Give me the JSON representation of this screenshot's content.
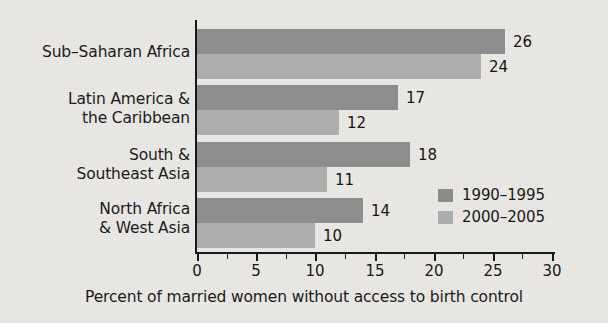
{
  "chart_data": {
    "type": "bar",
    "orientation": "horizontal",
    "title": "",
    "xlabel": "Percent of married women without access to birth control",
    "ylabel": "",
    "xlim": [
      0,
      30
    ],
    "xticks": [
      0,
      5,
      10,
      15,
      20,
      25,
      30
    ],
    "xtick_labels": [
      "0",
      "5",
      "10",
      "15",
      "20",
      "25",
      "30"
    ],
    "grid": false,
    "legend_position": "inside-right",
    "categories": [
      "Sub–Saharan Africa",
      "Latin America &\nthe Caribbean",
      "South &\nSoutheast Asia",
      "North Africa\n& West Asia"
    ],
    "series": [
      {
        "name": "1990–1995",
        "color": "#8d8d8d",
        "values": [
          26,
          17,
          18,
          14
        ],
        "value_labels": [
          "26",
          "17",
          "18",
          "14"
        ]
      },
      {
        "name": "2000–2005",
        "color": "#adadad",
        "values": [
          24,
          12,
          11,
          10
        ],
        "value_labels": [
          "24",
          "12",
          "11",
          "10"
        ]
      }
    ]
  },
  "colors": {
    "background": "#eceae6",
    "axis": "#151515",
    "text": "#181818",
    "series_1990": "#8d8d8d",
    "series_2000": "#adadad"
  },
  "axis": {
    "title": "Percent of married women without access to birth control",
    "ticks": [
      {
        "label": "0",
        "value": 0
      },
      {
        "label": "5",
        "value": 5
      },
      {
        "label": "10",
        "value": 10
      },
      {
        "label": "15",
        "value": 15
      },
      {
        "label": "20",
        "value": 20
      },
      {
        "label": "25",
        "value": 25
      },
      {
        "label": "30",
        "value": 30
      }
    ]
  },
  "categories": [
    {
      "label": "Sub–Saharan Africa"
    },
    {
      "label": "Latin America &\nthe Caribbean"
    },
    {
      "label": "South &\nSoutheast Asia"
    },
    {
      "label": "North Africa\n& West Asia"
    }
  ],
  "legend": {
    "items": [
      {
        "label": "1990–1995",
        "color": "#8d8d8d"
      },
      {
        "label": "2000–2005",
        "color": "#adadad"
      }
    ]
  },
  "bars": [
    {
      "value_label": "26",
      "series": "1990–1995",
      "category": "Sub–Saharan Africa"
    },
    {
      "value_label": "24",
      "series": "2000–2005",
      "category": "Sub–Saharan Africa"
    },
    {
      "value_label": "17",
      "series": "1990–1995",
      "category": "Latin America & the Caribbean"
    },
    {
      "value_label": "12",
      "series": "2000–2005",
      "category": "Latin America & the Caribbean"
    },
    {
      "value_label": "18",
      "series": "1990–1995",
      "category": "South & Southeast Asia"
    },
    {
      "value_label": "11",
      "series": "2000–2005",
      "category": "South & Southeast Asia"
    },
    {
      "value_label": "14",
      "series": "1990–1995",
      "category": "North Africa & West Asia"
    },
    {
      "value_label": "10",
      "series": "2000–2005",
      "category": "North Africa & West Asia"
    }
  ]
}
